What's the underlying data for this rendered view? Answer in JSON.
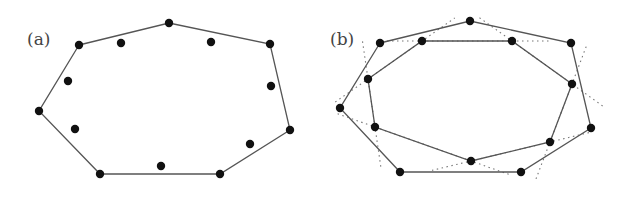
{
  "panels": [
    {
      "label": "(a)",
      "label_pos": [
        27,
        45
      ],
      "hull": [
        [
          79,
          45
        ],
        [
          169,
          23
        ],
        [
          270,
          44
        ],
        [
          290,
          130
        ],
        [
          220,
          174
        ],
        [
          100,
          174
        ],
        [
          39,
          111
        ]
      ],
      "extra_points": [
        [
          121,
          43
        ],
        [
          211,
          42
        ],
        [
          68,
          81
        ],
        [
          271,
          86
        ],
        [
          75,
          129
        ],
        [
          250,
          144
        ],
        [
          161,
          166
        ]
      ]
    },
    {
      "label": "(b)",
      "label_pos": [
        330,
        45
      ],
      "hull": [
        [
          380,
          43
        ],
        [
          470,
          21
        ],
        [
          571,
          43
        ],
        [
          591,
          128
        ],
        [
          521,
          172
        ],
        [
          400,
          172
        ],
        [
          340,
          108
        ]
      ],
      "inner": [
        [
          422,
          41
        ],
        [
          512,
          41
        ],
        [
          572,
          84
        ],
        [
          550,
          142
        ],
        [
          471,
          161
        ],
        [
          375,
          127
        ],
        [
          368,
          79
        ]
      ],
      "dotted_extension_px": 22
    }
  ],
  "colors": {
    "edge": "#555555",
    "dotted": "#777777",
    "point": "#111111"
  }
}
